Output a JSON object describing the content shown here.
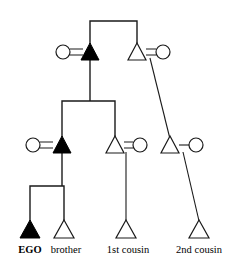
{
  "diagram": {
    "type": "kinship-genealogy-chart",
    "line_color": "#1a1a1a",
    "filled_color": "#000000",
    "open_color": "#ffffff",
    "background": "#ffffff",
    "symbol_legend": {
      "triangle": "male",
      "circle": "female",
      "filled": "consanguineal-line-of-descent",
      "open": "non-highlighted-relative",
      "equals": "marriage-union",
      "dash": "union"
    },
    "generations": [
      {
        "id": "generation-1",
        "name": "grandparents",
        "persons": [
          {
            "id": "g1-grandmother",
            "symbol": "circle",
            "fill": "open",
            "sex": "female",
            "x": 63,
            "y": 52
          },
          {
            "id": "g1-grandfather",
            "symbol": "triangle",
            "fill": "filled",
            "sex": "male",
            "x": 90,
            "y": 52
          },
          {
            "id": "g1-granduncle",
            "symbol": "triangle",
            "fill": "open",
            "sex": "male",
            "x": 137,
            "y": 52
          },
          {
            "id": "g1-grandaunt",
            "symbol": "circle",
            "fill": "open",
            "sex": "female",
            "x": 163,
            "y": 52
          }
        ],
        "unions": [
          {
            "id": "union-g1-left",
            "marker": "=",
            "between": [
              "g1-grandmother",
              "g1-grandfather"
            ],
            "x": 76,
            "y": 52
          },
          {
            "id": "union-g1-right",
            "marker": "=",
            "between": [
              "g1-granduncle",
              "g1-grandaunt"
            ],
            "x": 150,
            "y": 52
          }
        ]
      },
      {
        "id": "generation-2",
        "name": "parents-and-aunts-uncles",
        "persons": [
          {
            "id": "g2-mother",
            "symbol": "circle",
            "fill": "open",
            "sex": "female",
            "x": 33,
            "y": 145
          },
          {
            "id": "g2-father",
            "symbol": "triangle",
            "fill": "filled",
            "sex": "male",
            "x": 62,
            "y": 145
          },
          {
            "id": "g2-uncle",
            "symbol": "triangle",
            "fill": "open",
            "sex": "male",
            "x": 115,
            "y": 145
          },
          {
            "id": "g2-aunt",
            "symbol": "circle",
            "fill": "open",
            "sex": "female",
            "x": 140,
            "y": 145
          },
          {
            "id": "g2-parent-cousin-male",
            "symbol": "triangle",
            "fill": "open",
            "sex": "male",
            "x": 170,
            "y": 145
          },
          {
            "id": "g2-parent-cousin-female",
            "symbol": "circle",
            "fill": "open",
            "sex": "female",
            "x": 196,
            "y": 145
          }
        ],
        "unions": [
          {
            "id": "union-g2-parents",
            "marker": "=",
            "between": [
              "g2-mother",
              "g2-father"
            ],
            "x": 47,
            "y": 145
          },
          {
            "id": "union-g2-uncle-aunt",
            "marker": "=",
            "between": [
              "g2-uncle",
              "g2-aunt"
            ],
            "x": 128,
            "y": 145
          },
          {
            "id": "union-g2-cousin-parents",
            "marker": "-",
            "between": [
              "g2-parent-cousin-male",
              "g2-parent-cousin-female"
            ],
            "x": 183,
            "y": 145
          }
        ]
      },
      {
        "id": "generation-3",
        "name": "ego-generation",
        "persons": [
          {
            "id": "g3-ego",
            "symbol": "triangle",
            "fill": "filled",
            "sex": "male",
            "x": 30,
            "y": 228,
            "label": "EGO",
            "label_bold": true
          },
          {
            "id": "g3-brother",
            "symbol": "triangle",
            "fill": "open",
            "sex": "male",
            "x": 64,
            "y": 228,
            "label": "brother",
            "label_bold": false
          },
          {
            "id": "g3-first-cousin",
            "symbol": "triangle",
            "fill": "open",
            "sex": "male",
            "x": 126,
            "y": 228,
            "label": "1st cousin",
            "label_bold": false
          },
          {
            "id": "g3-second-cousin",
            "symbol": "triangle",
            "fill": "open",
            "sex": "male",
            "x": 199,
            "y": 228,
            "label": "2nd cousin",
            "label_bold": false
          }
        ]
      }
    ],
    "labels": [
      {
        "id": "label-ego",
        "text": "EGO",
        "x": 30,
        "y": 252,
        "bold": true
      },
      {
        "id": "label-brother",
        "text": "brother",
        "x": 65,
        "y": 252,
        "bold": false
      },
      {
        "id": "label-first-cousin",
        "text": "1st cousin",
        "x": 128,
        "y": 252,
        "bold": false
      },
      {
        "id": "label-second-cousin",
        "text": "2nd cousin",
        "x": 199,
        "y": 252,
        "bold": false
      }
    ],
    "connectors": [
      {
        "id": "sibling-bracket-generation-1",
        "kind": "sibling-bracket",
        "left_x": 90,
        "right_x": 137,
        "bar_y": 21,
        "drop_to_y": 44
      },
      {
        "id": "descent-stem-generation-1",
        "kind": "descent-stem",
        "from_x": 90,
        "from_y": 57,
        "to_y": 101
      },
      {
        "id": "sibling-bracket-generation-2",
        "kind": "sibling-bracket",
        "left_x": 62,
        "right_x": 115,
        "bar_y": 101,
        "drop_to_y": 137
      },
      {
        "id": "descent-stem-generation-2",
        "kind": "descent-stem",
        "from_x": 62,
        "from_y": 150,
        "to_y": 186
      },
      {
        "id": "sibling-bracket-generation-3",
        "kind": "sibling-bracket",
        "left_x": 30,
        "right_x": 64,
        "bar_y": 186,
        "drop_to_y": 221
      },
      {
        "id": "descent-line-first-cousin",
        "kind": "vertical-descent",
        "from_x": 126,
        "from_y": 151,
        "to_x": 126,
        "to_y": 221
      },
      {
        "id": "descent-line-cousin-parent",
        "kind": "diagonal-descent",
        "from_x": 150,
        "from_y": 57,
        "to_x": 170,
        "to_y": 139
      },
      {
        "id": "descent-line-second-cousin",
        "kind": "diagonal-descent",
        "from_x": 183,
        "from_y": 151,
        "to_x": 199,
        "to_y": 221
      }
    ]
  }
}
